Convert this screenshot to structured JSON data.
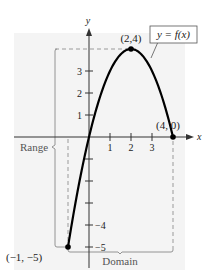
{
  "chart_data": {
    "type": "line",
    "title": "",
    "function_label": "y = f(x)",
    "xlabel": "x",
    "ylabel": "y",
    "xlim": [
      -3.6,
      4.6
    ],
    "ylim": [
      -5.9,
      4.9
    ],
    "x_ticks": [
      {
        "value": 1,
        "label": "1"
      },
      {
        "value": 2,
        "label": "2"
      },
      {
        "value": 3,
        "label": "3"
      }
    ],
    "y_ticks": [
      {
        "value": 3,
        "label": "3"
      },
      {
        "value": 2,
        "label": "2"
      },
      {
        "value": 1,
        "label": "1"
      },
      {
        "value": -1,
        "label": ""
      },
      {
        "value": -2,
        "label": ""
      },
      {
        "value": -3,
        "label": ""
      },
      {
        "value": -4,
        "label": "−4"
      },
      {
        "value": -5,
        "label": "−5"
      }
    ],
    "series": [
      {
        "name": "f(x) = -x^2 + 4x",
        "x": [
          -1,
          -0.5,
          0,
          0.5,
          1,
          1.5,
          2,
          2.5,
          3,
          3.5,
          4
        ],
        "y": [
          -5,
          -2.25,
          0,
          1.75,
          3,
          3.75,
          4,
          3.75,
          3,
          1.75,
          0
        ]
      }
    ],
    "points": [
      {
        "x": 2,
        "y": 4,
        "label": "(2,4)"
      },
      {
        "x": 4,
        "y": 0,
        "label": "(4, 0)"
      },
      {
        "x": -1,
        "y": -5,
        "label": "(−1, −5)"
      }
    ],
    "annotations": {
      "range_label": "Range",
      "range_interval": [
        -5,
        4
      ],
      "domain_label": "Domain",
      "domain_interval": [
        -1,
        4
      ]
    },
    "grid": false,
    "background_color": "#f4f4f4",
    "curve_color": "#000000",
    "dashed_color": "#9a9a9a"
  }
}
